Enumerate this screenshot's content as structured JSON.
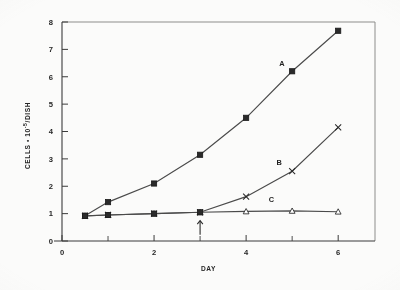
{
  "figure": {
    "background_color": "#fbfbfa",
    "ink_color": "#3b3b3b",
    "frame_color": "#8d8d8b"
  },
  "axes": {
    "x_title": "DAY",
    "y_title_main": "CELLS • 10",
    "y_title_exponent": "-5",
    "y_title_tail": "/DISH",
    "x_ticks": [
      "0",
      "2",
      "4",
      "6"
    ],
    "x_tick_values": [
      0,
      2,
      4,
      6
    ],
    "x_minor_values": [
      1,
      3,
      5
    ],
    "y_ticks": [
      "0",
      "1",
      "2",
      "3",
      "4",
      "5",
      "6",
      "7",
      "8"
    ],
    "y_tick_values": [
      0,
      1,
      2,
      3,
      4,
      5,
      6,
      7,
      8
    ]
  },
  "annotations": [
    {
      "name": "treatment-arrow",
      "symbol": "arrow-up",
      "x": 3,
      "y": 0.45,
      "label": ""
    }
  ],
  "series_labels": [
    {
      "text": "A",
      "x": 4.78,
      "y": 6.38
    },
    {
      "text": "B",
      "x": 4.72,
      "y": 2.78
    },
    {
      "text": "C",
      "x": 4.55,
      "y": 1.42
    }
  ],
  "chart_data": {
    "type": "line",
    "title": "",
    "xlabel": "DAY",
    "ylabel": "CELLS • 10^-5 / DISH",
    "xlim": [
      0,
      6.8
    ],
    "ylim": [
      0,
      8
    ],
    "grid": false,
    "legend": "inline-labels",
    "x": [
      0.5,
      1,
      2,
      3,
      4,
      5,
      6
    ],
    "series": [
      {
        "name": "A",
        "marker": "filled-square",
        "values": [
          0.92,
          1.42,
          2.1,
          3.15,
          4.5,
          6.2,
          7.68
        ]
      },
      {
        "name": "B",
        "marker": "cross-x",
        "values": [
          0.92,
          0.95,
          1.0,
          1.05,
          1.62,
          2.55,
          4.15
        ]
      },
      {
        "name": "C",
        "marker": "open-triangle",
        "values": [
          0.92,
          0.95,
          1.0,
          1.05,
          1.08,
          1.1,
          1.07
        ]
      }
    ]
  }
}
